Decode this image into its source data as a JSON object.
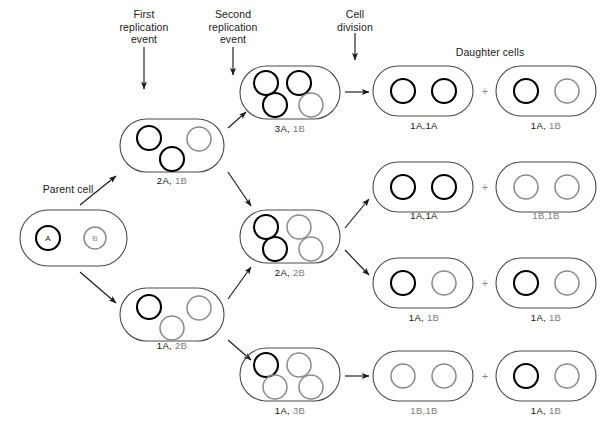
{
  "figure": {
    "colors": {
      "A_stroke": "#000000",
      "B_stroke": "#8a8a8a",
      "cell_stroke": "#4a4a4a",
      "arrow": "#1a1a1a",
      "text": "#202020",
      "text_gray": "#7d7d7d",
      "background": "#ffffff"
    }
  },
  "headers": [
    {
      "id": "first-replication-event",
      "text": "First\nreplication\nevent",
      "x": 144,
      "y": 8,
      "arrow": {
        "x": 144,
        "y": 47,
        "len": 42
      }
    },
    {
      "id": "second-replication-event",
      "text": "Second\nreplication\nevent",
      "x": 233,
      "y": 8,
      "arrow": {
        "x": 233,
        "y": 47,
        "len": 28
      }
    },
    {
      "id": "cell-division",
      "text": "Cell\ndivision",
      "x": 355,
      "y": 8,
      "arrow": {
        "x": 355,
        "y": 33,
        "len": 27
      }
    },
    {
      "id": "daughter-cells",
      "text": "Daughter cells",
      "x": 490,
      "y": 46,
      "arrow": null
    }
  ],
  "cells": [
    {
      "id": "parent-cell",
      "caption_above": "Parent cell",
      "caption_above_x": 68,
      "caption_above_y": 183,
      "label_parts": [],
      "x": 20,
      "y": 210,
      "w": 107,
      "h": 56,
      "circles": [
        {
          "type": "A",
          "cx": 48,
          "cy": 238,
          "r": 12,
          "glyph": "A"
        },
        {
          "type": "B",
          "cx": 95,
          "cy": 238,
          "r": 11,
          "glyph": "B"
        }
      ]
    },
    {
      "id": "cell-2A-1B",
      "label_parts": [
        {
          "t": "2A,",
          "c": "a"
        },
        {
          "t": " 1B",
          "c": "b"
        }
      ],
      "label_x": 172,
      "label_y": 175,
      "x": 120,
      "y": 119,
      "w": 104,
      "h": 53,
      "circles": [
        {
          "type": "A",
          "cx": 149,
          "cy": 138,
          "r": 12,
          "glyph": ""
        },
        {
          "type": "B",
          "cx": 199,
          "cy": 139,
          "r": 12,
          "glyph": ""
        },
        {
          "type": "A",
          "cx": 172,
          "cy": 159,
          "r": 12,
          "glyph": ""
        }
      ]
    },
    {
      "id": "cell-1A-2B",
      "label_parts": [
        {
          "t": "1A,",
          "c": "a"
        },
        {
          "t": " 2B",
          "c": "b"
        }
      ],
      "label_x": 172,
      "label_y": 340,
      "x": 120,
      "y": 288,
      "w": 104,
      "h": 53,
      "circles": [
        {
          "type": "A",
          "cx": 149,
          "cy": 307,
          "r": 12,
          "glyph": ""
        },
        {
          "type": "B",
          "cx": 199,
          "cy": 308,
          "r": 12,
          "glyph": ""
        },
        {
          "type": "B",
          "cx": 172,
          "cy": 328,
          "r": 12,
          "glyph": ""
        }
      ]
    },
    {
      "id": "cell-3A-1B",
      "label_parts": [
        {
          "t": "3A,",
          "c": "a"
        },
        {
          "t": " 1B",
          "c": "b"
        }
      ],
      "label_x": 290,
      "label_y": 123,
      "x": 240,
      "y": 66,
      "w": 100,
      "h": 53,
      "circles": [
        {
          "type": "A",
          "cx": 266,
          "cy": 83,
          "r": 12,
          "glyph": ""
        },
        {
          "type": "A",
          "cx": 299,
          "cy": 83,
          "r": 12,
          "glyph": ""
        },
        {
          "type": "A",
          "cx": 275,
          "cy": 105,
          "r": 12,
          "glyph": ""
        },
        {
          "type": "B",
          "cx": 311,
          "cy": 105,
          "r": 12,
          "glyph": ""
        }
      ]
    },
    {
      "id": "cell-2A-2B",
      "label_parts": [
        {
          "t": "2A,",
          "c": "a"
        },
        {
          "t": " 2B",
          "c": "b"
        }
      ],
      "label_x": 290,
      "label_y": 267,
      "x": 240,
      "y": 210,
      "w": 100,
      "h": 53,
      "circles": [
        {
          "type": "A",
          "cx": 266,
          "cy": 227,
          "r": 12,
          "glyph": ""
        },
        {
          "type": "B",
          "cx": 299,
          "cy": 227,
          "r": 12,
          "glyph": ""
        },
        {
          "type": "A",
          "cx": 275,
          "cy": 249,
          "r": 12,
          "glyph": ""
        },
        {
          "type": "B",
          "cx": 311,
          "cy": 249,
          "r": 12,
          "glyph": ""
        }
      ]
    },
    {
      "id": "cell-1A-3B",
      "label_parts": [
        {
          "t": "1A,",
          "c": "a"
        },
        {
          "t": " 3B",
          "c": "b"
        }
      ],
      "label_x": 290,
      "label_y": 405,
      "x": 240,
      "y": 348,
      "w": 100,
      "h": 53,
      "circles": [
        {
          "type": "A",
          "cx": 266,
          "cy": 365,
          "r": 12,
          "glyph": ""
        },
        {
          "type": "B",
          "cx": 299,
          "cy": 365,
          "r": 12,
          "glyph": ""
        },
        {
          "type": "B",
          "cx": 275,
          "cy": 387,
          "r": 12,
          "glyph": ""
        },
        {
          "type": "B",
          "cx": 311,
          "cy": 387,
          "r": 12,
          "glyph": ""
        }
      ]
    },
    {
      "id": "daughter-1A1A-row1",
      "label_parts": [
        {
          "t": "1A,1A",
          "c": "a"
        }
      ],
      "label_x": 424,
      "label_y": 120,
      "x": 373,
      "y": 66,
      "w": 100,
      "h": 50,
      "circles": [
        {
          "type": "A",
          "cx": 403,
          "cy": 91,
          "r": 12,
          "glyph": ""
        },
        {
          "type": "A",
          "cx": 444,
          "cy": 91,
          "r": 12,
          "glyph": ""
        }
      ]
    },
    {
      "id": "daughter-1A1B-row1",
      "label_parts": [
        {
          "t": "1A,",
          "c": "a"
        },
        {
          "t": " 1B",
          "c": "b"
        }
      ],
      "label_x": 546,
      "label_y": 120,
      "x": 496,
      "y": 66,
      "w": 100,
      "h": 50,
      "circles": [
        {
          "type": "A",
          "cx": 526,
          "cy": 91,
          "r": 12,
          "glyph": ""
        },
        {
          "type": "B",
          "cx": 567,
          "cy": 91,
          "r": 12,
          "glyph": ""
        }
      ]
    },
    {
      "id": "daughter-1A1A-row2",
      "label_parts": [
        {
          "t": "1A,1A",
          "c": "a"
        }
      ],
      "label_x": 424,
      "label_y": 210,
      "x": 373,
      "y": 162,
      "w": 100,
      "h": 50,
      "circles": [
        {
          "type": "A",
          "cx": 403,
          "cy": 187,
          "r": 12,
          "glyph": ""
        },
        {
          "type": "A",
          "cx": 444,
          "cy": 187,
          "r": 12,
          "glyph": ""
        }
      ]
    },
    {
      "id": "daughter-1B1B-row2",
      "label_parts": [
        {
          "t": "1B,1B",
          "c": "b"
        }
      ],
      "label_x": 546,
      "label_y": 210,
      "x": 496,
      "y": 162,
      "w": 100,
      "h": 50,
      "circles": [
        {
          "type": "B",
          "cx": 526,
          "cy": 187,
          "r": 12,
          "glyph": ""
        },
        {
          "type": "B",
          "cx": 567,
          "cy": 187,
          "r": 12,
          "glyph": ""
        }
      ]
    },
    {
      "id": "daughter-1A1B-row3",
      "label_parts": [
        {
          "t": "1A,",
          "c": "a"
        },
        {
          "t": " 1B",
          "c": "b"
        }
      ],
      "label_x": 424,
      "label_y": 312,
      "x": 373,
      "y": 258,
      "w": 100,
      "h": 50,
      "circles": [
        {
          "type": "A",
          "cx": 403,
          "cy": 283,
          "r": 12,
          "glyph": ""
        },
        {
          "type": "B",
          "cx": 444,
          "cy": 283,
          "r": 12,
          "glyph": ""
        }
      ]
    },
    {
      "id": "daughter-1A1B-row3b",
      "label_parts": [
        {
          "t": "1A,",
          "c": "a"
        },
        {
          "t": " 1B",
          "c": "b"
        }
      ],
      "label_x": 546,
      "label_y": 312,
      "x": 496,
      "y": 258,
      "w": 100,
      "h": 50,
      "circles": [
        {
          "type": "A",
          "cx": 526,
          "cy": 283,
          "r": 12,
          "glyph": ""
        },
        {
          "type": "B",
          "cx": 567,
          "cy": 283,
          "r": 12,
          "glyph": ""
        }
      ]
    },
    {
      "id": "daughter-1B1B-row4",
      "label_parts": [
        {
          "t": "1B,1B",
          "c": "b"
        }
      ],
      "label_x": 424,
      "label_y": 405,
      "x": 373,
      "y": 351,
      "w": 100,
      "h": 50,
      "circles": [
        {
          "type": "B",
          "cx": 403,
          "cy": 376,
          "r": 12,
          "glyph": ""
        },
        {
          "type": "B",
          "cx": 444,
          "cy": 376,
          "r": 12,
          "glyph": ""
        }
      ]
    },
    {
      "id": "daughter-1A1B-row4",
      "label_parts": [
        {
          "t": "1A,",
          "c": "a"
        },
        {
          "t": " 1B",
          "c": "b"
        }
      ],
      "label_x": 546,
      "label_y": 405,
      "x": 496,
      "y": 351,
      "w": 100,
      "h": 50,
      "circles": [
        {
          "type": "A",
          "cx": 526,
          "cy": 376,
          "r": 12,
          "glyph": ""
        },
        {
          "type": "B",
          "cx": 567,
          "cy": 376,
          "r": 12,
          "glyph": ""
        }
      ]
    }
  ],
  "plus_signs": [
    {
      "id": "plus-row1",
      "text": "+",
      "x": 485,
      "y": 91
    },
    {
      "id": "plus-row2",
      "text": "+",
      "x": 485,
      "y": 187
    },
    {
      "id": "plus-row3",
      "text": "+",
      "x": 485,
      "y": 283
    },
    {
      "id": "plus-row4",
      "text": "+",
      "x": 485,
      "y": 376
    }
  ],
  "arrows": [
    {
      "id": "arrow-parent-to-2A1B",
      "x1": 80,
      "y1": 205,
      "x2": 116,
      "y2": 176
    },
    {
      "id": "arrow-parent-to-1A2B",
      "x1": 80,
      "y1": 272,
      "x2": 116,
      "y2": 303
    },
    {
      "id": "arrow-2A1B-to-3A1B",
      "x1": 228,
      "y1": 128,
      "x2": 246,
      "y2": 112
    },
    {
      "id": "arrow-2A1B-to-2A2B",
      "x1": 228,
      "y1": 172,
      "x2": 251,
      "y2": 206
    },
    {
      "id": "arrow-1A2B-to-2A2B",
      "x1": 228,
      "y1": 299,
      "x2": 251,
      "y2": 267
    },
    {
      "id": "arrow-1A2B-to-1A3B",
      "x1": 228,
      "y1": 340,
      "x2": 251,
      "y2": 360
    },
    {
      "id": "arrow-3A1B-to-daughters",
      "x1": 345,
      "y1": 92,
      "x2": 369,
      "y2": 92
    },
    {
      "id": "arrow-2A2B-to-row2",
      "x1": 345,
      "y1": 228,
      "x2": 369,
      "y2": 199
    },
    {
      "id": "arrow-2A2B-to-row3",
      "x1": 345,
      "y1": 250,
      "x2": 369,
      "y2": 275
    },
    {
      "id": "arrow-1A3B-to-daughters",
      "x1": 345,
      "y1": 376,
      "x2": 369,
      "y2": 376
    }
  ]
}
